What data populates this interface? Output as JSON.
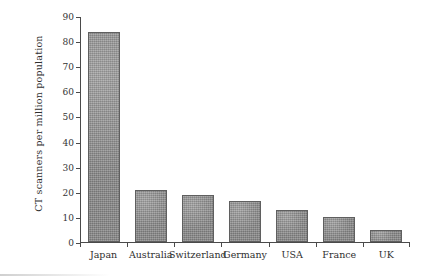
{
  "chart_data": {
    "type": "bar",
    "title": "",
    "xlabel": "",
    "ylabel": "CT scanners per million population",
    "categories": [
      "Japan",
      "Australia",
      "Switzerland",
      "Germany",
      "USA",
      "France",
      "UK"
    ],
    "values": [
      84,
      21,
      19,
      16.5,
      13,
      10,
      5
    ],
    "ylim": [
      0,
      90
    ],
    "yticks": [
      0,
      10,
      20,
      30,
      40,
      50,
      60,
      70,
      80,
      90
    ],
    "ytick_labels": [
      "0",
      "10",
      "20",
      "30",
      "40",
      "50",
      "60",
      "70",
      "80",
      "90"
    ],
    "grid": false,
    "legend": false,
    "bar_color": "#8d8d8d",
    "bar_edge_color": "#5f5f5f",
    "axis_color": "#4a4a4a",
    "background": "#ffffff"
  }
}
